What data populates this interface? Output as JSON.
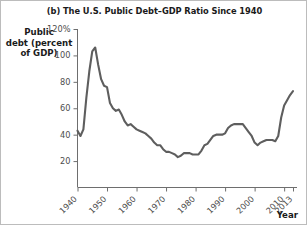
{
  "chart_data": {
    "type": "line",
    "title": "(b) The U.S. Public Debt–GDP Ratio Since 1940",
    "xlabel": "Year",
    "ylabel": "Public debt (percent of GDP)",
    "ylabel_lines": [
      "Public",
      "debt (percent",
      "of GDP)"
    ],
    "xlim": [
      1940,
      2013
    ],
    "ylim": [
      0,
      120
    ],
    "grid": false,
    "legend": null,
    "line_color": "#5e5e5e",
    "y_ticks": [
      {
        "value": 120,
        "label": "120%"
      },
      {
        "value": 100,
        "label": "100"
      },
      {
        "value": 80,
        "label": "80"
      },
      {
        "value": 60,
        "label": "60"
      },
      {
        "value": 40,
        "label": "40"
      },
      {
        "value": 20,
        "label": "20"
      }
    ],
    "x_ticks": [
      {
        "value": 1940,
        "label": "1940"
      },
      {
        "value": 1950,
        "label": "1950"
      },
      {
        "value": 1960,
        "label": "1960"
      },
      {
        "value": 1970,
        "label": "1970"
      },
      {
        "value": 1980,
        "label": "1980"
      },
      {
        "value": 1990,
        "label": "1990"
      },
      {
        "value": 2000,
        "label": "2000"
      },
      {
        "value": 2010,
        "label": "2010"
      },
      {
        "value": 2013,
        "label": "2013"
      }
    ],
    "series": [
      {
        "name": "U.S. public debt as percent of GDP",
        "x": [
          1940,
          1941,
          1942,
          1943,
          1944,
          1945,
          1946,
          1947,
          1948,
          1949,
          1950,
          1951,
          1952,
          1953,
          1954,
          1955,
          1956,
          1957,
          1958,
          1959,
          1960,
          1961,
          1962,
          1963,
          1964,
          1965,
          1966,
          1967,
          1968,
          1969,
          1970,
          1971,
          1972,
          1973,
          1974,
          1975,
          1976,
          1977,
          1978,
          1979,
          1980,
          1981,
          1982,
          1983,
          1984,
          1985,
          1986,
          1987,
          1988,
          1989,
          1990,
          1991,
          1992,
          1993,
          1994,
          1995,
          1996,
          1997,
          1998,
          1999,
          2000,
          2001,
          2002,
          2003,
          2004,
          2005,
          2006,
          2007,
          2008,
          2009,
          2010,
          2011,
          2012,
          2013
        ],
        "values": [
          43,
          39,
          44,
          68,
          88,
          103,
          106,
          93,
          82,
          77,
          76,
          64,
          60,
          58,
          59,
          55,
          50,
          47,
          48,
          46,
          44,
          43,
          42,
          41,
          39,
          37,
          34,
          32,
          32,
          29,
          27,
          27,
          26,
          25,
          23,
          24,
          26,
          26,
          26,
          25,
          25,
          25,
          28,
          32,
          33,
          36,
          39,
          40,
          40,
          40,
          41,
          45,
          47,
          48,
          48,
          48,
          48,
          45,
          42,
          39,
          34,
          32,
          34,
          35,
          36,
          36,
          36,
          35,
          39,
          53,
          62,
          66,
          70,
          73
        ]
      }
    ],
    "annotations": []
  }
}
